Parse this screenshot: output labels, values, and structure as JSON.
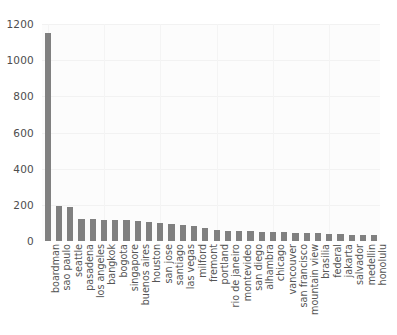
{
  "chart_data": {
    "type": "bar",
    "title": "",
    "xlabel": "",
    "ylabel": "",
    "ylim": [
      0,
      1200
    ],
    "yticks": [
      0,
      200,
      400,
      600,
      800,
      1000,
      1200
    ],
    "grid": true,
    "legend": null,
    "bar_color": "#808080",
    "plot_background": "#fcfcfc",
    "categories": [
      "boardman",
      "sao paulo",
      "seattle",
      "pasadena",
      "los angeles",
      "bangkok",
      "bogota",
      "singapore",
      "buenos aires",
      "houston",
      "san jose",
      "santiago",
      "las vegas",
      "milford",
      "fremont",
      "portland",
      "rio de janeiro",
      "montevideo",
      "san diego",
      "alhambra",
      "chicago",
      "vancouver",
      "san francisco",
      "mountain view",
      "brasilia",
      "federal",
      "jakarta",
      "salvador",
      "medellin",
      "honolulu"
    ],
    "values": [
      1150,
      192,
      190,
      122,
      120,
      118,
      116,
      114,
      110,
      105,
      100,
      96,
      90,
      84,
      74,
      62,
      58,
      56,
      54,
      52,
      50,
      48,
      46,
      44,
      42,
      40,
      38,
      36,
      34,
      32
    ]
  }
}
